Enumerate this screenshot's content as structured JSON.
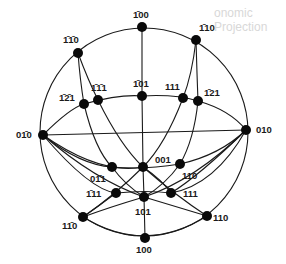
{
  "background_bleed_text": "onomic Projection",
  "primitive_circle": {
    "cx": 144,
    "cy": 132,
    "r": 104
  },
  "poles": [
    {
      "id": "p_m100",
      "label": "1̄00",
      "x": 142,
      "y": 27,
      "lx": 133,
      "ly": 18
    },
    {
      "id": "p_m110",
      "label": "1̄10",
      "x": 196,
      "y": 40,
      "lx": 199,
      "ly": 31
    },
    {
      "id": "p_m1m10",
      "label": "1̄1̄0",
      "x": 78,
      "y": 53,
      "lx": 63,
      "ly": 43
    },
    {
      "id": "p_m101",
      "label": "1̄01",
      "x": 142,
      "y": 96,
      "lx": 133,
      "ly": 87
    },
    {
      "id": "p_m1m11",
      "label": "1̄1̄1",
      "x": 98,
      "y": 100,
      "lx": 91,
      "ly": 91
    },
    {
      "id": "p_m1m21",
      "label": "1̄2̄1",
      "x": 84,
      "y": 104,
      "lx": 59,
      "ly": 101
    },
    {
      "id": "p_111_up",
      "label": "111",
      "x": 183,
      "y": 98,
      "lx": 165,
      "ly": 90
    },
    {
      "id": "p_m121",
      "label": "1̄21",
      "x": 198,
      "y": 101,
      "lx": 204,
      "ly": 96
    },
    {
      "id": "p_0m10",
      "label": "01̄0",
      "x": 43,
      "y": 135,
      "lx": 16,
      "ly": 138
    },
    {
      "id": "p_010",
      "label": "010",
      "x": 246,
      "y": 130,
      "lx": 256,
      "ly": 133
    },
    {
      "id": "p_0m11",
      "label": "01̄1",
      "x": 112,
      "y": 167,
      "lx": 90,
      "ly": 182
    },
    {
      "id": "p_001",
      "label": "001",
      "x": 143,
      "y": 167,
      "lx": 155,
      "ly": 163
    },
    {
      "id": "p_110_mid",
      "label": "110",
      "x": 180,
      "y": 164,
      "lx": 182,
      "ly": 179
    },
    {
      "id": "p_m111",
      "label": "1̄11",
      "x": 116,
      "y": 193,
      "lx": 86,
      "ly": 197
    },
    {
      "id": "p_101",
      "label": "101",
      "x": 144,
      "y": 197,
      "lx": 135,
      "ly": 215
    },
    {
      "id": "p_111_low",
      "label": "111",
      "x": 171,
      "y": 193,
      "lx": 183,
      "ly": 197
    },
    {
      "id": "p_1m10",
      "label": "11̄0",
      "x": 83,
      "y": 217,
      "lx": 62,
      "ly": 229
    },
    {
      "id": "p_110_low",
      "label": "110",
      "x": 207,
      "y": 216,
      "lx": 213,
      "ly": 221
    },
    {
      "id": "p_100",
      "label": "100",
      "x": 145,
      "y": 238,
      "lx": 136,
      "ly": 253
    }
  ],
  "great_circles": [
    {
      "id": "gc_vertical",
      "d": "M142,27 L142,96 L143,167 L144,197 L145,238"
    },
    {
      "id": "gc_equator_horizontal",
      "d": "M43,135 L246,130"
    },
    {
      "id": "gc_upper_ellipse",
      "d": "M43,135 Q70,108 84,104 Q120,94 142,96 Q175,94 198,101 Q230,110 246,130"
    },
    {
      "id": "gc_lower_ellipse",
      "d": "M43,135 Q80,165 112,167 Q143,170 180,164 Q220,155 246,130"
    },
    {
      "id": "gc_left_a",
      "d": "M78,53 Q80,80 84,104 Q95,150 112,167 Q125,185 144,197"
    },
    {
      "id": "gc_left_b",
      "d": "M78,53 Q88,80 98,100 Q120,145 143,167 Q175,195 207,216"
    },
    {
      "id": "gc_right_a",
      "d": "M196,40 Q192,75 183,98 Q165,145 143,167 Q115,195 83,217"
    },
    {
      "id": "gc_right_b",
      "d": "M196,40 Q197,75 198,101 Q194,140 180,164 Q165,185 144,197"
    },
    {
      "id": "gc_0m10_to_110low",
      "d": "M43,135 Q95,180 144,197 Q180,208 207,216"
    },
    {
      "id": "gc_0m10_to_111low",
      "d": "M43,135 Q100,175 143,167 Q162,180 171,193"
    },
    {
      "id": "gc_010_to_1m10",
      "d": "M246,130 Q195,180 144,197 Q110,207 83,217"
    },
    {
      "id": "gc_010_to_m111",
      "d": "M246,130 Q200,175 171,193 Q145,190 116,193 Q100,205 83,217"
    },
    {
      "id": "gc_bottom_arc",
      "d": "M83,217 Q145,255 207,216"
    },
    {
      "id": "gc_m111_chain",
      "d": "M43,135 Q90,190 116,193"
    },
    {
      "id": "gc_111_chain",
      "d": "M246,130 Q215,185 171,193"
    }
  ]
}
